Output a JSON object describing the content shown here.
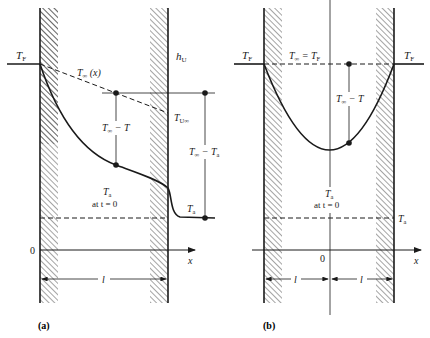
{
  "figure": {
    "panels": [
      {
        "id": "a",
        "caption": "(a)",
        "labels": {
          "t_f": "T",
          "t_f_sub": "F",
          "h_u": "h",
          "h_u_sub": "U",
          "t_inf_x": "T",
          "t_inf_x_sub": "∞",
          "t_inf_x_arg": " (x)",
          "t_u_inf": "T",
          "t_u_inf_sub": "U∞",
          "t_inf_minus_t": "T",
          "t_inf_minus_t_sub": "∞",
          "t_inf_minus_t_rest": " − T",
          "t_inf_minus_ta": "T",
          "t_inf_minus_ta_sub": "∞",
          "t_inf_minus_ta_rest": " − T",
          "t_inf_minus_ta_sub2": "a",
          "t_a_center": "T",
          "t_a_center_sub": "a",
          "at_t0": "at t = 0",
          "t_a_right": "T",
          "t_a_right_sub": "a",
          "origin": "0",
          "x_axis": "x",
          "length": "l"
        }
      },
      {
        "id": "b",
        "caption": "(b)",
        "labels": {
          "t_f_left": "T",
          "t_f_left_sub": "F",
          "t_f_right": "T",
          "t_f_right_sub": "F",
          "t_inf_eq": "T",
          "t_inf_eq_sub": "∞",
          "t_inf_eq_rest": " = T",
          "t_inf_eq_sub2": "F",
          "t_inf_minus_t": "T",
          "t_inf_minus_t_sub": "∞",
          "t_inf_minus_t_rest": " − T",
          "t_a_center": "T",
          "t_a_center_sub": "a",
          "at_t0": "at t = 0",
          "t_a_right": "T",
          "t_a_right_sub": "a",
          "origin": "0",
          "x_axis": "x",
          "length_left": "l",
          "length_right": "l"
        }
      }
    ],
    "colors": {
      "ink": "#1a1a1a",
      "background": "#ffffff"
    }
  }
}
